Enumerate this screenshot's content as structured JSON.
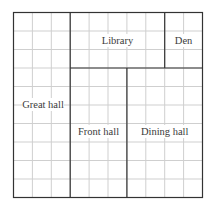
{
  "diagram": {
    "type": "floor-plan",
    "grid": {
      "columns": 10,
      "rows": 10
    },
    "colors": {
      "grid_line": "#cfcfcf",
      "wall": "#333333",
      "text": "#3a3a3a"
    },
    "rooms": [
      {
        "name": "Great hall",
        "cols": [
          0,
          3
        ],
        "rows": [
          0,
          10
        ]
      },
      {
        "name": "Library",
        "cols": [
          3,
          8
        ],
        "rows": [
          0,
          3
        ]
      },
      {
        "name": "Den",
        "cols": [
          8,
          10
        ],
        "rows": [
          0,
          3
        ]
      },
      {
        "name": "Front hall",
        "cols": [
          3,
          6
        ],
        "rows": [
          3,
          10
        ]
      },
      {
        "name": "Dining hall",
        "cols": [
          6,
          10
        ],
        "rows": [
          3,
          10
        ]
      }
    ],
    "labels": {
      "great_hall": "Great hall",
      "library": "Library",
      "den": "Den",
      "front_hall": "Front hall",
      "dining_hall": "Dining hall"
    }
  }
}
